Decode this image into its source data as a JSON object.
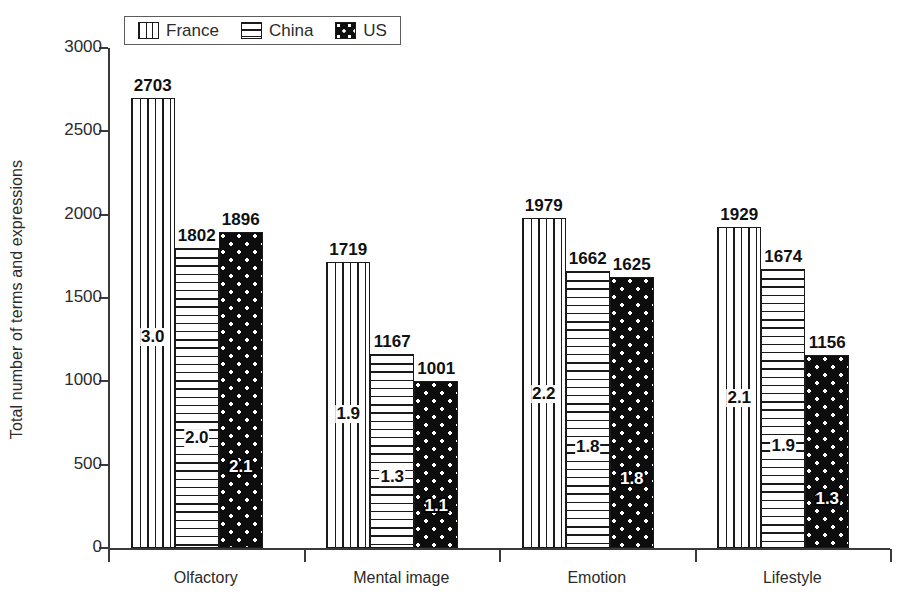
{
  "chart_data": {
    "type": "bar",
    "title": "",
    "xlabel": "",
    "ylabel": "Total number of terms and expressions",
    "categories": [
      "Olfactory",
      "Mental image",
      "Emotion",
      "Lifestyle"
    ],
    "ylim": [
      0,
      3000
    ],
    "yticks": [
      0,
      500,
      1000,
      1500,
      2000,
      2500,
      3000
    ],
    "ytick_labels": [
      "0",
      "500",
      "1000",
      "1500",
      "2000",
      "2500",
      "3000"
    ],
    "grid": false,
    "legend_position": "top-left",
    "series": [
      {
        "name": "France",
        "pattern": "vertical-stripes",
        "values": [
          2703,
          1719,
          1979,
          1929
        ],
        "value_labels": [
          "2703",
          "1719",
          "1979",
          "1929"
        ],
        "inner_labels": [
          "3.0",
          "1.9",
          "2.2",
          "2.1"
        ]
      },
      {
        "name": "China",
        "pattern": "horizontal-stripes",
        "values": [
          1802,
          1167,
          1662,
          1674
        ],
        "value_labels": [
          "1802",
          "1167",
          "1662",
          "1674"
        ],
        "inner_labels": [
          "2.0",
          "1.3",
          "1.8",
          "1.9"
        ]
      },
      {
        "name": "US",
        "pattern": "black-with-white-dots",
        "values": [
          1896,
          1001,
          1625,
          1156
        ],
        "value_labels": [
          "1896",
          "1001",
          "1625",
          "1156"
        ],
        "inner_labels": [
          "2.1",
          "1.1",
          "1.8",
          "1.3"
        ]
      }
    ]
  },
  "legend": {
    "entries": [
      {
        "label": "France",
        "swatch": "vertical-stripes-swatch"
      },
      {
        "label": "China",
        "swatch": "horizontal-stripes-swatch"
      },
      {
        "label": "US",
        "swatch": "black-dots-swatch"
      }
    ]
  },
  "colors": {
    "ink": "#1a1a1a",
    "axis": "#3a3a3a",
    "background": "#ffffff",
    "us_fill": "#0d0d0d",
    "dot": "#ffffff"
  }
}
